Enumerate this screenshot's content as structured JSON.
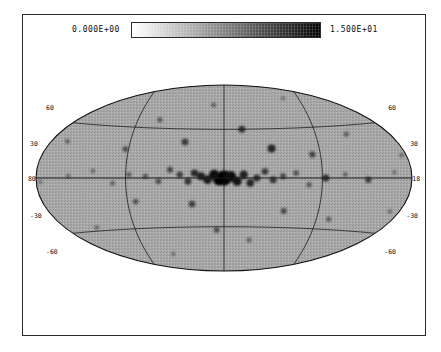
{
  "figure": {
    "type": "all-sky-map",
    "projection": "Aitoff",
    "coordinate_system": "galactic"
  },
  "colorbar": {
    "min_label": "0.000E+00",
    "max_label": "1.500E+01",
    "min_value": 0,
    "max_value": 15,
    "orientation": "horizontal",
    "ramp": "white-to-black"
  },
  "grid": {
    "latitude_labels": [
      "60",
      "30",
      "-30",
      "-60"
    ],
    "longitude_labels": [
      "180",
      "180"
    ],
    "latitude_lines": [
      60,
      30,
      0,
      -30,
      -60
    ],
    "longitude_lines": [
      -120,
      -60,
      0,
      60,
      120
    ]
  },
  "axis_labels": {
    "lat_top_left": "60",
    "lat_top_right": "60",
    "lat_mid_left": "30",
    "lat_mid_right": "30",
    "lon_left": "180",
    "lon_right": "180",
    "lat_low_left": "-30",
    "lat_low_right": "-30",
    "lat_bot_left": "-60",
    "lat_bot_right": "-60"
  },
  "chart_data": {
    "type": "heatmap",
    "title": "",
    "xlabel": "",
    "ylabel": "",
    "projection": "Aitoff",
    "value_range": [
      0,
      15
    ],
    "colormap": "grayscale_inverted",
    "background_level": 2.5,
    "sources": [
      {
        "l": 0,
        "b": 0,
        "v": 15.0,
        "r": 7.5
      },
      {
        "l": 3,
        "b": -1,
        "v": 14.2,
        "r": 6.0
      },
      {
        "l": -4,
        "b": 1,
        "v": 13.5,
        "r": 5.5
      },
      {
        "l": 6,
        "b": 2,
        "v": 12.8,
        "r": 5.0
      },
      {
        "l": -8,
        "b": -2,
        "v": 12.0,
        "r": 4.6
      },
      {
        "l": 10,
        "b": -1,
        "v": 11.5,
        "r": 4.4
      },
      {
        "l": -12,
        "b": 2,
        "v": 11.0,
        "r": 4.2
      },
      {
        "l": 14,
        "b": 1,
        "v": 10.6,
        "r": 4.0
      },
      {
        "l": -16,
        "b": -3,
        "v": 10.2,
        "r": 3.8
      },
      {
        "l": 18,
        "b": 3,
        "v": 9.8,
        "r": 3.7
      },
      {
        "l": -20,
        "b": 0,
        "v": 9.4,
        "r": 3.6
      },
      {
        "l": 22,
        "b": -2,
        "v": 9.0,
        "r": 3.4
      },
      {
        "l": -25,
        "b": 4,
        "v": 8.6,
        "r": 3.3
      },
      {
        "l": 27,
        "b": 2,
        "v": 8.2,
        "r": 3.2
      },
      {
        "l": -30,
        "b": -1,
        "v": 8.8,
        "r": 3.5
      },
      {
        "l": 33,
        "b": 5,
        "v": 7.6,
        "r": 3.0
      },
      {
        "l": -36,
        "b": 1,
        "v": 7.4,
        "r": 3.0
      },
      {
        "l": 40,
        "b": -2,
        "v": 7.0,
        "r": 2.9
      },
      {
        "l": -44,
        "b": 3,
        "v": 6.8,
        "r": 2.8
      },
      {
        "l": 48,
        "b": 1,
        "v": 6.5,
        "r": 2.7
      },
      {
        "l": -52,
        "b": -4,
        "v": 6.2,
        "r": 2.7
      },
      {
        "l": 58,
        "b": 2,
        "v": 6.0,
        "r": 2.6
      },
      {
        "l": -62,
        "b": 0,
        "v": 9.5,
        "r": 3.6
      },
      {
        "l": 68,
        "b": -3,
        "v": 5.6,
        "r": 2.5
      },
      {
        "l": -74,
        "b": 2,
        "v": 5.4,
        "r": 2.5
      },
      {
        "l": 80,
        "b": 4,
        "v": 5.2,
        "r": 2.4
      },
      {
        "l": -88,
        "b": -1,
        "v": 8.0,
        "r": 3.2
      },
      {
        "l": 95,
        "b": 1,
        "v": 5.0,
        "r": 2.4
      },
      {
        "l": -104,
        "b": 3,
        "v": 4.8,
        "r": 2.3
      },
      {
        "l": 112,
        "b": -2,
        "v": 4.6,
        "r": 2.3
      },
      {
        "l": -120,
        "b": 1,
        "v": 7.2,
        "r": 2.9
      },
      {
        "l": 130,
        "b": 2,
        "v": 4.4,
        "r": 2.2
      },
      {
        "l": -140,
        "b": -2,
        "v": 4.2,
        "r": 2.2
      },
      {
        "l": 150,
        "b": 1,
        "v": 4.0,
        "r": 2.1
      },
      {
        "l": -160,
        "b": 3,
        "v": 3.8,
        "r": 2.1
      },
      {
        "l": 168,
        "b": -1,
        "v": 3.6,
        "r": 2.0
      },
      {
        "l": -30,
        "b": 18,
        "v": 10.5,
        "r": 4.0
      },
      {
        "l": 25,
        "b": 22,
        "v": 8.5,
        "r": 3.4
      },
      {
        "l": -55,
        "b": 14,
        "v": 7.8,
        "r": 3.1
      },
      {
        "l": 62,
        "b": 17,
        "v": 7.0,
        "r": 2.9
      },
      {
        "l": -12,
        "b": 30,
        "v": 9.0,
        "r": 3.5
      },
      {
        "l": 45,
        "b": 35,
        "v": 6.4,
        "r": 2.7
      },
      {
        "l": -80,
        "b": 25,
        "v": 6.0,
        "r": 2.6
      },
      {
        "l": 100,
        "b": 20,
        "v": 5.6,
        "r": 2.5
      },
      {
        "l": -110,
        "b": 12,
        "v": 5.2,
        "r": 2.4
      },
      {
        "l": 125,
        "b": 28,
        "v": 4.8,
        "r": 2.3
      },
      {
        "l": -140,
        "b": 20,
        "v": 4.4,
        "r": 2.2
      },
      {
        "l": 8,
        "b": 45,
        "v": 5.8,
        "r": 2.5
      },
      {
        "l": -48,
        "b": 48,
        "v": 4.6,
        "r": 2.3
      },
      {
        "l": 70,
        "b": 52,
        "v": 4.2,
        "r": 2.2
      },
      {
        "l": -95,
        "b": 42,
        "v": 4.0,
        "r": 2.1
      },
      {
        "l": 20,
        "b": -16,
        "v": 8.2,
        "r": 3.3
      },
      {
        "l": -38,
        "b": -20,
        "v": 7.5,
        "r": 3.0
      },
      {
        "l": 55,
        "b": -14,
        "v": 6.8,
        "r": 2.8
      },
      {
        "l": -68,
        "b": -24,
        "v": 6.2,
        "r": 2.6
      },
      {
        "l": 5,
        "b": -32,
        "v": 7.0,
        "r": 2.9
      },
      {
        "l": -18,
        "b": -38,
        "v": 5.8,
        "r": 2.5
      },
      {
        "l": 85,
        "b": -28,
        "v": 5.4,
        "r": 2.4
      },
      {
        "l": -105,
        "b": -18,
        "v": 5.0,
        "r": 2.4
      },
      {
        "l": 118,
        "b": -22,
        "v": 4.6,
        "r": 2.3
      },
      {
        "l": -132,
        "b": -30,
        "v": 4.2,
        "r": 2.2
      },
      {
        "l": 40,
        "b": -46,
        "v": 4.8,
        "r": 2.3
      },
      {
        "l": -72,
        "b": -50,
        "v": 4.4,
        "r": 2.2
      },
      {
        "l": 150,
        "b": 10,
        "v": 3.8,
        "r": 2.0
      },
      {
        "l": -152,
        "b": -8,
        "v": 3.6,
        "r": 2.0
      },
      {
        "l": 160,
        "b": -14,
        "v": 3.4,
        "r": 2.0
      },
      {
        "l": -170,
        "b": 8,
        "v": 3.4,
        "r": 2.0
      }
    ]
  }
}
